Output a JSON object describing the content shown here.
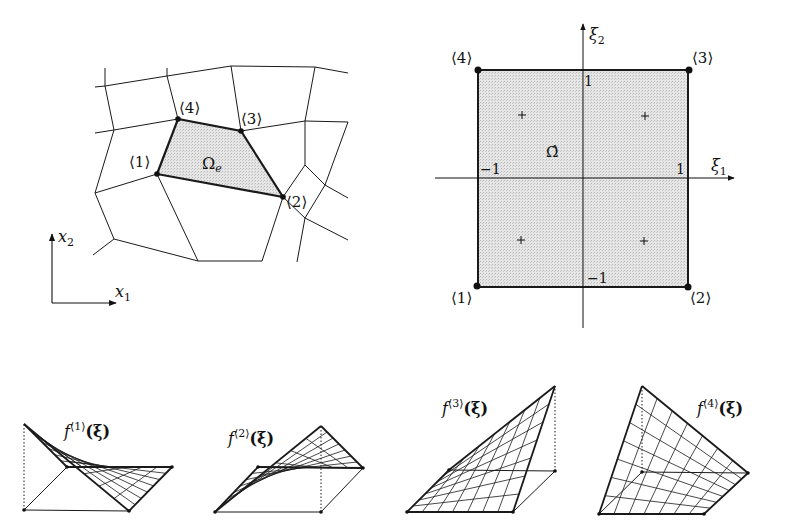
{
  "colors": {
    "stroke": "#1a1a1a",
    "element_fill": "#dedede",
    "background": "#ffffff"
  },
  "physical_mesh": {
    "element_label": "Ω",
    "element_label_sub": "e",
    "nodes": [
      {
        "label": "⟨1⟩",
        "x": 157,
        "y": 174
      },
      {
        "label": "⟨2⟩",
        "x": 283,
        "y": 197
      },
      {
        "label": "⟨3⟩",
        "x": 241,
        "y": 131
      },
      {
        "label": "⟨4⟩",
        "x": 178,
        "y": 119
      }
    ],
    "axes": {
      "x_label": "x",
      "x_sub": "1",
      "y_label": "x",
      "y_sub": "2"
    }
  },
  "reference_element": {
    "label": "Ω̂",
    "axis_h": {
      "label": "ξ",
      "sub": "1"
    },
    "axis_v": {
      "label": "ξ",
      "sub": "2"
    },
    "ticks": {
      "pos_x": "1",
      "neg_x": "−1",
      "pos_y": "1",
      "neg_y": "−1"
    },
    "nodes": [
      {
        "label": "⟨1⟩",
        "xi1": -1,
        "xi2": -1
      },
      {
        "label": "⟨2⟩",
        "xi1": 1,
        "xi2": -1
      },
      {
        "label": "⟨3⟩",
        "xi1": 1,
        "xi2": 1
      },
      {
        "label": "⟨4⟩",
        "xi1": -1,
        "xi2": 1
      }
    ],
    "gauss_points_marker": "+",
    "gauss_points_count": 4
  },
  "shape_functions": [
    {
      "name": "f",
      "sup": "⟨1⟩",
      "arg": "(ξ)",
      "peak_node": 1
    },
    {
      "name": "f",
      "sup": "⟨2⟩",
      "arg": "(ξ)",
      "peak_node": 2
    },
    {
      "name": "f",
      "sup": "⟨3⟩",
      "arg": "(ξ)",
      "peak_node": 3
    },
    {
      "name": "f",
      "sup": "⟨4⟩",
      "arg": "(ξ)",
      "peak_node": 4
    }
  ]
}
